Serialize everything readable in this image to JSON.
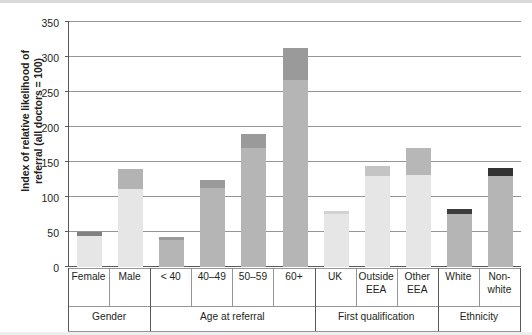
{
  "chart_data": {
    "type": "bar",
    "title": "",
    "xlabel": "",
    "ylabel": "Index of relative likelihood of referral (all doctors = 100)",
    "ylim": [
      0,
      350
    ],
    "ytick_labels": [
      "0",
      "50",
      "100",
      "150",
      "200",
      "250",
      "300",
      "350"
    ],
    "ytick_values": [
      0,
      50,
      100,
      150,
      200,
      250,
      300,
      350
    ],
    "grid": true,
    "legend": "none",
    "stacked": true,
    "categories": [
      "Female",
      "Male",
      "< 40",
      "40–49",
      "50–59",
      "60+",
      "UK",
      "Outside EEA",
      "Other EEA",
      "White",
      "Non-white"
    ],
    "series": [
      {
        "name": "lower segment",
        "values": [
          44,
          112,
          38,
          113,
          170,
          267,
          76,
          130,
          132,
          76,
          130
        ]
      },
      {
        "name": "upper segment",
        "values": [
          6,
          28,
          5,
          11,
          20,
          46,
          4,
          15,
          38,
          7,
          11
        ]
      }
    ],
    "values": [
      50,
      140,
      43,
      124,
      190,
      313,
      80,
      145,
      170,
      83,
      141
    ],
    "groups": [
      {
        "label": "Gender",
        "categories": [
          {
            "label": "Female",
            "label_line2": "",
            "total": 50,
            "base": 44,
            "top": 6,
            "base_color": "#e6e6e6",
            "top_color": "#808080"
          },
          {
            "label": "Male",
            "label_line2": "",
            "total": 140,
            "base": 112,
            "top": 28,
            "base_color": "#e6e6e6",
            "top_color": "#b3b3b3"
          }
        ]
      },
      {
        "label": "Age at referral",
        "categories": [
          {
            "label": "< 40",
            "label_line2": "",
            "total": 43,
            "base": 38,
            "top": 5,
            "base_color": "#b5b5b5",
            "top_color": "#9a9a9a"
          },
          {
            "label": "40–49",
            "label_line2": "",
            "total": 124,
            "base": 113,
            "top": 11,
            "base_color": "#b5b5b5",
            "top_color": "#9a9a9a"
          },
          {
            "label": "50–59",
            "label_line2": "",
            "total": 190,
            "base": 170,
            "top": 20,
            "base_color": "#b5b5b5",
            "top_color": "#9a9a9a"
          },
          {
            "label": "60+",
            "label_line2": "",
            "total": 313,
            "base": 267,
            "top": 46,
            "base_color": "#b5b5b5",
            "top_color": "#9a9a9a"
          }
        ]
      },
      {
        "label": "First qualification",
        "categories": [
          {
            "label": "UK",
            "label_line2": "",
            "total": 80,
            "base": 76,
            "top": 4,
            "base_color": "#e6e6e6",
            "top_color": "#d2d2d2"
          },
          {
            "label": "Outside",
            "label_line2": "EEA",
            "total": 145,
            "base": 130,
            "top": 15,
            "base_color": "#e6e6e6",
            "top_color": "#c4c4c4"
          },
          {
            "label": "Other",
            "label_line2": "EEA",
            "total": 170,
            "base": 132,
            "top": 38,
            "base_color": "#e6e6e6",
            "top_color": "#b7b7b7"
          }
        ]
      },
      {
        "label": "Ethnicity",
        "categories": [
          {
            "label": "White",
            "label_line2": "",
            "total": 83,
            "base": 76,
            "top": 7,
            "base_color": "#b5b5b5",
            "top_color": "#3b3b3b"
          },
          {
            "label": "Non-",
            "label_line2": "white",
            "total": 141,
            "base": 130,
            "top": 11,
            "base_color": "#b5b5b5",
            "top_color": "#333333"
          }
        ]
      }
    ]
  },
  "colors": {
    "axis": "#58595b",
    "grid": "#939598",
    "text": "#231f20",
    "light_bar": "#e6e6e6",
    "mid_bar": "#b5b5b5",
    "dark_cap": "#333333"
  }
}
